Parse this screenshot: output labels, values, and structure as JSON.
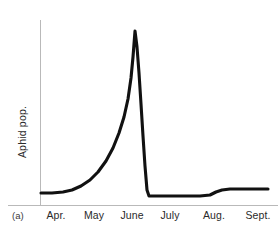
{
  "figure": {
    "panel_label": "(a)",
    "background_color": "#ffffff",
    "curve_color": "#111111",
    "axis_color": "#b9b9b9",
    "text_color": "#2a2a2a"
  },
  "chart_data": {
    "type": "line",
    "title": "",
    "subtitle": "",
    "xlabel": "",
    "ylabel": "Aphid pop.",
    "grid": false,
    "legend": null,
    "annotations": [
      "(a)"
    ],
    "categories": [
      "Apr.",
      "May",
      "June",
      "July",
      "Aug.",
      "Sept."
    ],
    "tick_labels": [
      "Apr.",
      "May",
      "June",
      "July",
      "Aug.",
      "Sept."
    ],
    "xlim": [
      0,
      6
    ],
    "ylim": [
      0,
      1
    ],
    "y_axis_ticks": [],
    "series": [
      {
        "name": "Aphid pop.",
        "color": "#111111",
        "x": [
          0.05,
          0.45,
          0.9,
          1.35,
          1.8,
          2.1,
          2.35,
          2.55,
          2.68,
          2.78,
          2.86,
          2.92,
          2.98,
          3.05,
          3.45,
          4.0,
          4.4,
          4.62,
          4.85,
          5.2,
          5.95
        ],
        "values": [
          0.06,
          0.062,
          0.075,
          0.105,
          0.17,
          0.245,
          0.36,
          0.54,
          0.7,
          0.86,
          0.96,
          1.0,
          0.62,
          0.045,
          0.042,
          0.042,
          0.042,
          0.06,
          0.075,
          0.077,
          0.078
        ],
        "description": "Low flat baseline through April into May, exponential increase through late May and June to a sharp narrow peak, abrupt near-vertical crash to a very low plateau in early July, flat through July, a small step increase during August, then flat through September."
      }
    ],
    "path_points_px": {
      "note": "pixel coordinates of the drawn polyline in the 280x232 image",
      "points": [
        [
          41,
          193
        ],
        [
          52,
          193
        ],
        [
          63,
          192
        ],
        [
          72,
          190
        ],
        [
          81,
          186
        ],
        [
          90,
          180
        ],
        [
          98,
          172
        ],
        [
          106,
          161
        ],
        [
          113,
          148
        ],
        [
          119,
          133
        ],
        [
          124,
          117
        ],
        [
          128,
          99
        ],
        [
          131,
          78
        ],
        [
          133,
          57
        ],
        [
          135,
          31
        ],
        [
          137,
          47
        ],
        [
          139,
          73
        ],
        [
          141,
          104
        ],
        [
          143,
          136
        ],
        [
          145,
          166
        ],
        [
          147,
          190
        ],
        [
          149,
          196
        ],
        [
          158,
          196
        ],
        [
          172,
          196
        ],
        [
          186,
          196
        ],
        [
          200,
          196
        ],
        [
          210,
          195
        ],
        [
          216,
          192
        ],
        [
          222,
          190
        ],
        [
          230,
          189
        ],
        [
          242,
          189
        ],
        [
          256,
          189
        ],
        [
          268,
          189
        ]
      ]
    }
  },
  "axes": {
    "y_axis": {
      "name": "y-axis-line",
      "x_px": 40,
      "y_top_px": 20,
      "y_bottom_px": 205
    },
    "x_axis": {
      "name": "x-axis-line",
      "y_px": 205,
      "x_left_px": 8,
      "x_right_px": 278
    }
  },
  "tick_label_positions_px": [
    {
      "label": "Apr.",
      "x": 56
    },
    {
      "label": "May",
      "x": 94
    },
    {
      "label": "June",
      "x": 132
    },
    {
      "label": "July",
      "x": 170
    },
    {
      "label": "Aug.",
      "x": 214
    },
    {
      "label": "Sept.",
      "x": 258
    }
  ]
}
